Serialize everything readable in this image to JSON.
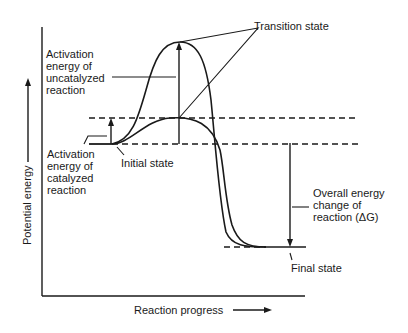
{
  "diagram": {
    "type": "energy-profile",
    "axes": {
      "y_label": "Potential energy",
      "x_label": "Reaction progress"
    },
    "labels": {
      "transition_state": "Transition state",
      "uncatalyzed_activation": [
        "Activation",
        "energy of",
        "uncatalyzed",
        "reaction"
      ],
      "catalyzed_activation": [
        "Activation",
        "energy of",
        "catalyzed",
        "reaction"
      ],
      "initial_state": "Initial state",
      "overall_change": [
        "Overall energy",
        "change of",
        "reaction (ΔG)"
      ],
      "final_state": "Final state"
    },
    "curves": [
      {
        "name": "Uncatalyzed reaction",
        "peak": "high"
      },
      {
        "name": "Catalyzed reaction",
        "peak": "low"
      }
    ],
    "colors": {
      "line": "#1a1a1a",
      "background": "#ffffff"
    }
  }
}
